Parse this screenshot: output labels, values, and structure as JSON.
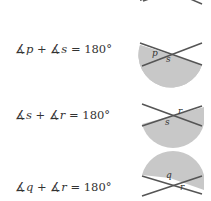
{
  "equations": [
    {
      "angle1": "p",
      "angle2": "s",
      "sum": "180°"
    },
    {
      "angle1": "s",
      "angle2": "r",
      "sum": "180°"
    },
    {
      "angle1": "q",
      "angle2": "r",
      "sum": "180°"
    }
  ],
  "symbols": {
    "angle": "∡",
    "plus": "+",
    "equals": "="
  },
  "figures": [
    {
      "labels": [
        "p",
        "s"
      ]
    },
    {
      "labels": [
        "s",
        "r"
      ]
    },
    {
      "labels": [
        "q",
        "r"
      ]
    }
  ],
  "colors": {
    "shade": "#c8c8c8",
    "line": "#555555",
    "text": "#333333"
  }
}
